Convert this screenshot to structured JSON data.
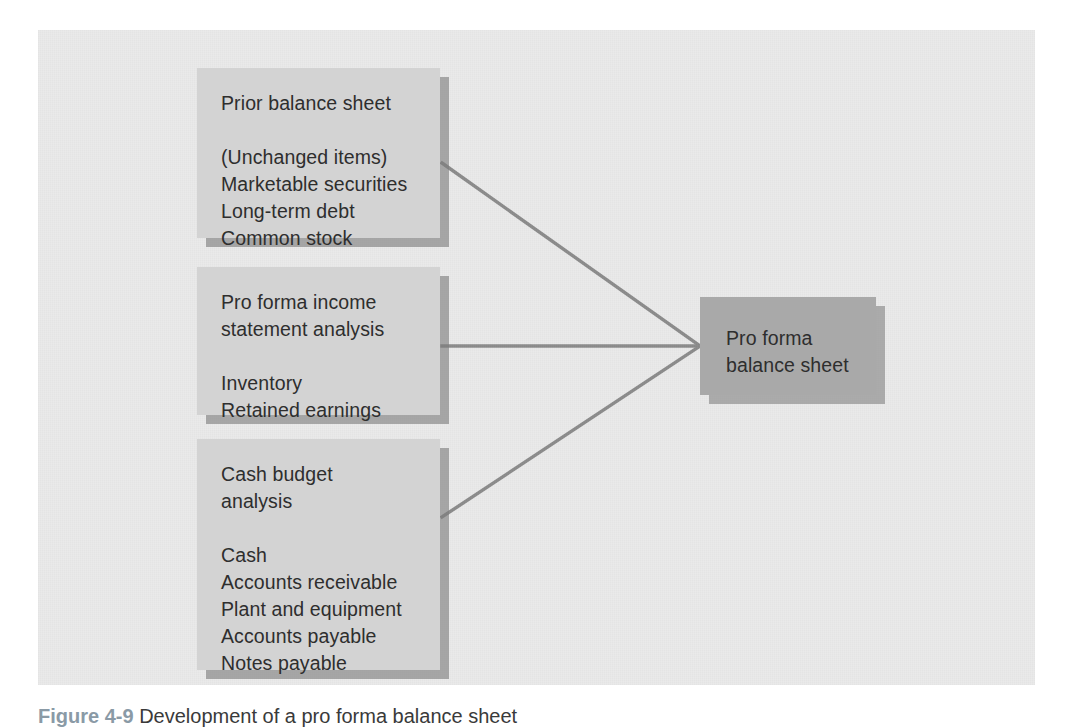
{
  "figure": {
    "caption_label": "Figure 4-9",
    "caption_text": "Development of a pro forma balance sheet",
    "panel_background": "#eaeaea",
    "source_box_color": "#d3d3d3",
    "destination_box_color": "#a9a9a9",
    "connector_color": "#8c8c8c"
  },
  "nodes": {
    "prior_balance_sheet": {
      "title": "Prior balance sheet",
      "items": "(Unchanged items)\nMarketable securities\nLong-term debt\nCommon stock"
    },
    "income_statement": {
      "title": "Pro forma income\nstatement analysis",
      "items": "Inventory\nRetained earnings"
    },
    "cash_budget": {
      "title": "Cash budget\nanalysis",
      "items": "Cash\nAccounts receivable\nPlant and equipment\nAccounts payable\nNotes payable"
    },
    "pro_forma_balance_sheet": {
      "title": "Pro forma\nbalance sheet"
    }
  },
  "connectors": [
    {
      "name": "prior-balance-sheet-to-pro-forma",
      "from": "prior_balance_sheet",
      "to": "pro_forma_balance_sheet"
    },
    {
      "name": "income-statement-to-pro-forma",
      "from": "income_statement",
      "to": "pro_forma_balance_sheet"
    },
    {
      "name": "cash-budget-to-pro-forma",
      "from": "cash_budget",
      "to": "pro_forma_balance_sheet"
    }
  ]
}
